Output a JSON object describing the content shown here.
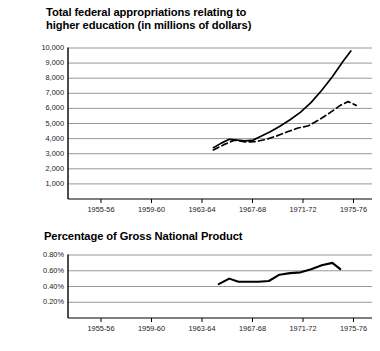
{
  "chart_data": [
    {
      "id": "federal-appropriations",
      "type": "line",
      "title": "Total federal appropriations relating to\nhigher education (in millions of dollars)",
      "xlabel": "",
      "ylabel": "",
      "grid": true,
      "legend": "none",
      "ylim": [
        0,
        10000
      ],
      "yticks": [
        10000,
        9000,
        8000,
        7000,
        6000,
        5000,
        4000,
        3000,
        2000,
        1000
      ],
      "ytick_labels": [
        "10,000",
        "9,000",
        "8,000",
        "7,000",
        "6,000",
        "5,000",
        "4,000",
        "3,000",
        "2,000",
        "1,000"
      ],
      "xtick_labels": [
        "1955-56",
        "1959-60",
        "1963-64",
        "1967-68",
        "1971-72",
        "1975-76"
      ],
      "xlim": [
        1954,
        1977
      ],
      "series": [
        {
          "name": "solid-line",
          "style": "solid",
          "x": [
            1965.0,
            1965.6,
            1966.2,
            1966.8,
            1967.4,
            1968.0,
            1968.6,
            1969.3,
            1970.0,
            1970.8,
            1971.6,
            1972.4,
            1973.2,
            1974.0,
            1974.8,
            1975.4
          ],
          "values": [
            3400,
            3700,
            3950,
            3900,
            3850,
            3900,
            4150,
            4450,
            4800,
            5250,
            5750,
            6400,
            7200,
            8100,
            9100,
            9800
          ]
        },
        {
          "name": "dashed-line",
          "style": "dashed",
          "x": [
            1965.0,
            1965.8,
            1966.6,
            1967.4,
            1968.2,
            1969.0,
            1969.8,
            1970.6,
            1971.4,
            1972.2,
            1973.0,
            1973.8,
            1974.6,
            1975.2,
            1975.8
          ],
          "values": [
            3250,
            3600,
            3900,
            3780,
            3800,
            3950,
            4180,
            4450,
            4700,
            4850,
            5250,
            5700,
            6200,
            6450,
            6200
          ]
        }
      ]
    },
    {
      "id": "percentage-gnp",
      "type": "line",
      "title": "Percentage of Gross National Product",
      "xlabel": "",
      "ylabel": "",
      "grid": true,
      "legend": "none",
      "ylim": [
        0,
        0.8
      ],
      "yticks": [
        0.8,
        0.6,
        0.4,
        0.2
      ],
      "ytick_labels": [
        "0.80%",
        "0.60%",
        "0.40%",
        "0.20%"
      ],
      "xtick_labels": [
        "1955-56",
        "1959-60",
        "1963-64",
        "1967-68",
        "1971-72",
        "1975-76"
      ],
      "xlim": [
        1954,
        1977
      ],
      "series": [
        {
          "name": "gnp-line",
          "style": "solid",
          "x": [
            1965.4,
            1966.2,
            1966.9,
            1967.6,
            1968.4,
            1969.2,
            1970.0,
            1970.8,
            1971.6,
            1972.4,
            1973.2,
            1974.0,
            1974.6
          ],
          "values": [
            0.43,
            0.5,
            0.46,
            0.46,
            0.46,
            0.47,
            0.55,
            0.57,
            0.58,
            0.62,
            0.67,
            0.7,
            0.62
          ]
        }
      ]
    }
  ],
  "colors": {
    "line": "#000000",
    "grid": "#8d8d8d",
    "axis": "#000000",
    "background": "#ffffff",
    "text": "#111111"
  }
}
